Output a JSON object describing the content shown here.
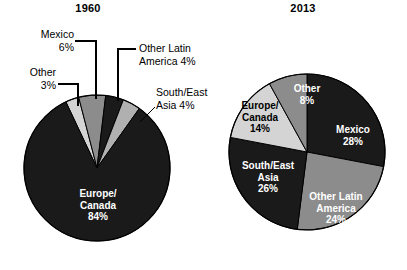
{
  "figure": {
    "background": "#ffffff",
    "panels": [
      "1960",
      "2013"
    ]
  },
  "colors": {
    "dark": "#1a1a1a",
    "mid_gray": "#8c8c8c",
    "light_gray": "#d4d4d4",
    "outline": "#000000",
    "label_on_dark": "#ffffff",
    "label_on_light": "#000000"
  },
  "panel_1960": {
    "title": "1960",
    "callouts": {
      "mexico_name": "Mexico",
      "mexico_pct": "6%",
      "other_name": "Other",
      "other_pct": "3%",
      "ola_line1": "Other Latin",
      "ola_line2": "America 4%",
      "sea_line1": "South/East",
      "sea_line2": "Asia 4%"
    },
    "inner_labels": {
      "europe_line1": "Europe/",
      "europe_line2": "Canada",
      "europe_pct": "84%"
    }
  },
  "panel_2013": {
    "title": "2013",
    "inner_labels": {
      "other_name": "Other",
      "other_pct": "8%",
      "europe_line1": "Europe/",
      "europe_line2": "Canada",
      "europe_pct": "14%",
      "sea_line1": "South/East",
      "sea_line2": "Asia",
      "sea_pct": "26%",
      "ola_line1": "Other Latin",
      "ola_line2": "America",
      "ola_pct": "24%",
      "mexico_name": "Mexico",
      "mexico_pct": "28%"
    }
  },
  "chart_data": [
    {
      "type": "pie",
      "title": "1960",
      "categories": [
        "Other",
        "Mexico",
        "Other Latin America",
        "South/East Asia",
        "Europe/Canada"
      ],
      "values": [
        3,
        6,
        4,
        4,
        84
      ],
      "labels": [
        "Other 3%",
        "Mexico 6%",
        "Other Latin America 4%",
        "South/East Asia 4%",
        "Europe/Canada 84%"
      ],
      "colors": [
        "#d4d4d4",
        "#8c8c8c",
        "#1a1a1a",
        "#b0b0b0",
        "#1a1a1a"
      ],
      "unit": "percent",
      "start_angle_deg": -25.2,
      "direction": "clockwise",
      "legend": "none",
      "label_placement": [
        "callout",
        "callout",
        "callout",
        "callout",
        "inside"
      ]
    },
    {
      "type": "pie",
      "title": "2013",
      "categories": [
        "Mexico",
        "Other Latin America",
        "South/East Asia",
        "Europe/Canada",
        "Other"
      ],
      "values": [
        28,
        24,
        26,
        14,
        8
      ],
      "labels": [
        "Mexico 28%",
        "Other Latin America 24%",
        "South/East Asia 26%",
        "Europe/Canada 14%",
        "Other 8%"
      ],
      "colors": [
        "#1a1a1a",
        "#8c8c8c",
        "#1a1a1a",
        "#d4d4d4",
        "#8c8c8c"
      ],
      "unit": "percent",
      "start_angle_deg": 0,
      "direction": "clockwise",
      "legend": "none",
      "label_placement": [
        "inside",
        "inside",
        "inside",
        "inside",
        "inside"
      ]
    }
  ]
}
